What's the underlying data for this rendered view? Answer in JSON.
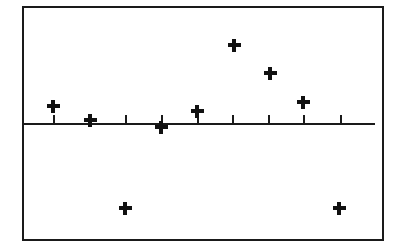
{
  "figure": {
    "title": "",
    "background_color": "#ffffff",
    "line_color": "#1a1a1a",
    "marker_color": "#111111",
    "frame": {
      "x": 22,
      "y": 6,
      "width": 362,
      "height": 235,
      "border_width": 2
    }
  },
  "chart_data": {
    "type": "scatter",
    "title": "",
    "subtitle": "",
    "xlabel": "",
    "ylabel": "",
    "xlim": [
      0,
      10
    ],
    "ylim": [
      -1.0,
      1.0
    ],
    "grid": false,
    "legend": null,
    "annotations": [],
    "marker": "plus",
    "zero_line": true,
    "x_tick_count": 9,
    "x_tick_values": [
      1,
      2,
      3,
      4,
      5,
      6,
      7,
      8,
      9
    ],
    "x_ticklabels": [
      "",
      "",
      "",
      "",
      "",
      "",
      "",
      "",
      ""
    ],
    "y_ticklabels": [],
    "x": [
      1,
      2,
      3,
      4,
      5,
      6,
      7,
      8,
      9
    ],
    "y": [
      0.15,
      0.02,
      -0.79,
      -0.04,
      0.11,
      0.72,
      0.47,
      0.2,
      -0.79
    ],
    "points": [
      {
        "index": 1,
        "x": 1,
        "y": 0.15,
        "px": 53,
        "py": 106
      },
      {
        "index": 2,
        "x": 2,
        "y": 0.02,
        "px": 90,
        "py": 120
      },
      {
        "index": 3,
        "x": 3,
        "y": -0.79,
        "px": 125,
        "py": 208
      },
      {
        "index": 4,
        "x": 4,
        "y": -0.04,
        "px": 161,
        "py": 127
      },
      {
        "index": 5,
        "x": 5,
        "y": 0.11,
        "px": 197,
        "py": 111
      },
      {
        "index": 6,
        "x": 6,
        "y": 0.72,
        "px": 234,
        "py": 45
      },
      {
        "index": 7,
        "x": 7,
        "y": 0.47,
        "px": 270,
        "py": 73
      },
      {
        "index": 8,
        "x": 8,
        "y": 0.2,
        "px": 303,
        "py": 102
      },
      {
        "index": 9,
        "x": 9,
        "y": -0.79,
        "px": 339,
        "py": 208
      }
    ],
    "axis_line": {
      "y_px": 123,
      "x_start_px": 24,
      "x_end_px": 375
    },
    "ticks_px": [
      53,
      90,
      125,
      161,
      197,
      232,
      268,
      303,
      340
    ],
    "tick_length_px": 8
  }
}
